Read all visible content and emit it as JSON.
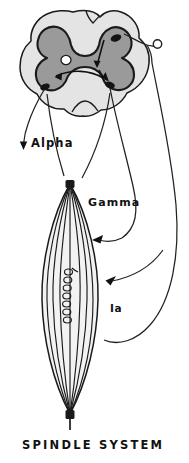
{
  "figure": {
    "title": "SPINDLE SYSTEM",
    "labels": {
      "alpha": "Alpha",
      "gamma": "Gamma",
      "ia": "Ia"
    },
    "parts": [
      {
        "name": "spinal-cord-cross-section",
        "description": "Transverse section of spinal cord with butterfly-shaped gray matter"
      },
      {
        "name": "gray-matter",
        "description": "H / butterfly shaped central gray matter"
      },
      {
        "name": "central-canal",
        "description": "Small white circle at center of gray matter"
      },
      {
        "name": "white-matter",
        "description": "Light outer region of the cord"
      },
      {
        "name": "dorsal-root-ganglion",
        "description": "Small open circle on the dorsal root"
      },
      {
        "name": "muscle-spindle",
        "description": "Fusiform muscle spindle with intrafusal fibers"
      },
      {
        "name": "annulospiral-ending",
        "description": "Coiled primary sensory ending on the intrafusal fiber"
      },
      {
        "name": "alpha-motor-pathway",
        "description": "Alpha motor neuron axon leaving the ventral horn"
      },
      {
        "name": "gamma-motor-pathway",
        "description": "Gamma motor neuron axon to the spindle poles"
      },
      {
        "name": "ia-afferent-pathway",
        "description": "Ia sensory afferent from spindle to the cord"
      }
    ],
    "colors": {
      "ink": "#111111",
      "gray_matter": "#9a9a9a",
      "white_matter": "#e4e4e4",
      "spindle_fill": "#f2f2f2",
      "background": "#ffffff"
    }
  }
}
